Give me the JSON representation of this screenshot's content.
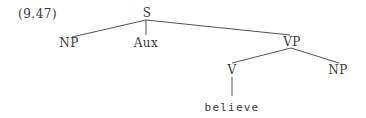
{
  "example_number": "(9.47)",
  "tree": {
    "root": "S",
    "nodes": {
      "s": "S",
      "np_subject": "NP",
      "aux": "Aux",
      "vp": "VP",
      "v": "V",
      "np_object": "NP",
      "verb_word": "believe"
    },
    "structure": "[S NP Aux [VP [V believe] NP]]"
  }
}
